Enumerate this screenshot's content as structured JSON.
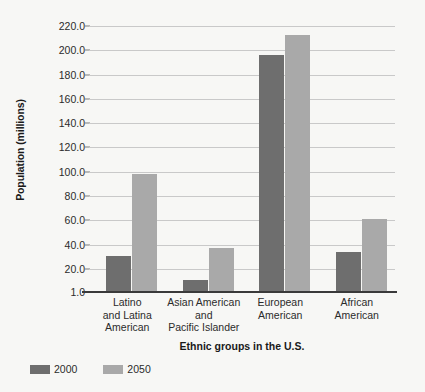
{
  "chart_data": {
    "type": "bar",
    "title": "",
    "xlabel": "Ethnic groups in the U.S.",
    "ylabel": "Population (millions)",
    "categories": [
      "Latino\nand Latina\nAmerican",
      "Asian American\nand\nPacific Islander",
      "European\nAmerican",
      "African\nAmerican"
    ],
    "series": [
      {
        "name": "2000",
        "color": "#6e6e6e",
        "values": [
          31,
          11,
          196,
          34
        ]
      },
      {
        "name": "2050",
        "color": "#a9a9a9",
        "values": [
          98,
          37,
          213,
          61
        ]
      }
    ],
    "ylim": [
      1.0,
      220.0
    ],
    "yticks": [
      1.0,
      20.0,
      40.0,
      60.0,
      80.0,
      100.0,
      120.0,
      140.0,
      160.0,
      180.0,
      200.0,
      220.0
    ],
    "ytick_labels": [
      "1.0",
      "20.0",
      "40.0",
      "60.0",
      "80.0",
      "100.0",
      "120.0",
      "140.0",
      "160.0",
      "180.0",
      "200.0",
      "220.0"
    ],
    "grid": true,
    "legend_position": "bottom-left"
  }
}
